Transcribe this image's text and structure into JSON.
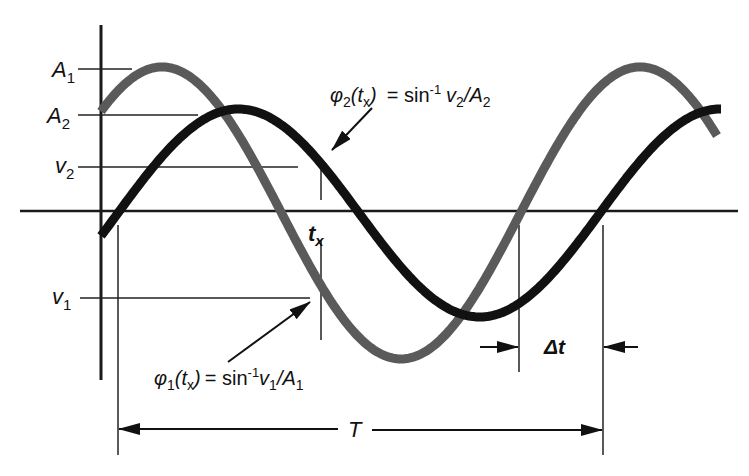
{
  "figure": {
    "colors": {
      "background": "#ffffff",
      "wave1": "#5a5a5a",
      "wave2": "#111111",
      "axes": "#1a1a1a",
      "guides": "#222222"
    },
    "labels": {
      "A1": {
        "base": "A",
        "sub": "1"
      },
      "A2": {
        "base": "A",
        "sub": "2"
      },
      "v2": {
        "base": "v",
        "sub": "2"
      },
      "v1": {
        "base": "v",
        "sub": "1"
      },
      "tx": {
        "base": "t",
        "sub": "x"
      },
      "delta_t": "Δt",
      "period": "T"
    },
    "annotations": {
      "phi2": {
        "phi": "φ",
        "phi_sub": "2",
        "paren_open": "(t",
        "t_sub": "x",
        "paren_close": ")",
        "eq": "= sin",
        "sup": "-1",
        "v": "v",
        "v_sub": "2",
        "slash_A": "/A",
        "A_sub": "2"
      },
      "phi1": {
        "phi": "φ",
        "phi_sub": "1",
        "paren_open": "(t",
        "t_sub": "x",
        "paren_close": ")",
        "eq": "= sin",
        "sup": "-1",
        "v": "v",
        "v_sub": "1",
        "slash_A": "/A",
        "A_sub": "1"
      }
    }
  },
  "chart_data": {
    "type": "line",
    "title": "",
    "xlabel": "t",
    "ylabel": "v",
    "series": [
      {
        "name": "v1 (grey, amplitude A1)",
        "amplitude": "A1",
        "relative_amplitude": 1.44,
        "phase_lead_over_v2": "Δt",
        "period": "T"
      },
      {
        "name": "v2 (black, amplitude A2)",
        "amplitude": "A2",
        "relative_amplitude": 1.0,
        "period": "T"
      }
    ],
    "markers": [
      "A1",
      "A2",
      "v1",
      "v2",
      "tx",
      "Δt",
      "T"
    ],
    "grid": false
  }
}
